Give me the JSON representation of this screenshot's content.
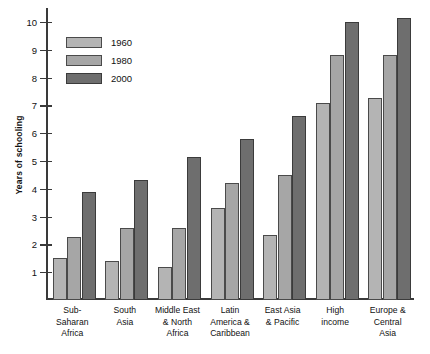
{
  "chart_data": {
    "type": "bar",
    "title": "",
    "xlabel": "",
    "ylabel": "Years of schooling",
    "ylim": [
      0,
      10.5
    ],
    "yticks": [
      1,
      2,
      3,
      4,
      5,
      6,
      7,
      8,
      9,
      10
    ],
    "ytick_labels": [
      "1",
      "2",
      "3",
      "4",
      "5",
      "6",
      "7",
      "8",
      "9",
      "10"
    ],
    "grid": false,
    "legend_position": "upper-left-inside",
    "categories": [
      "Sub-\nSaharan\nAfrica",
      "South\nAsia",
      "Middle East\n& North\nAfrica",
      "Latin\nAmerica &\nCaribbean",
      "East Asia\n& Pacific",
      "High\nincome",
      "Europe &\nCentral\nAsia"
    ],
    "category_lines": [
      [
        "Sub-",
        "Saharan",
        "Africa"
      ],
      [
        "South",
        "Asia"
      ],
      [
        "Middle East",
        "& North",
        "Africa"
      ],
      [
        "Latin",
        "America &",
        "Caribbean"
      ],
      [
        "East Asia",
        "& Pacific"
      ],
      [
        "High",
        "income"
      ],
      [
        "Europe &",
        "Central",
        "Asia"
      ]
    ],
    "series": [
      {
        "name": "1960",
        "color": "#b4b4b4",
        "values": [
          1.5,
          1.4,
          1.2,
          3.3,
          2.35,
          7.1,
          7.25
        ]
      },
      {
        "name": "1980",
        "color": "#a6a6a6",
        "values": [
          2.25,
          2.6,
          2.6,
          4.2,
          4.5,
          8.8,
          8.8
        ]
      },
      {
        "name": "2000",
        "color": "#6e6e6e",
        "values": [
          3.9,
          4.3,
          5.15,
          5.8,
          6.6,
          10.0,
          10.15
        ]
      }
    ]
  },
  "legend": {
    "items": [
      {
        "label": "1960"
      },
      {
        "label": "1980"
      },
      {
        "label": "2000"
      }
    ]
  },
  "axis": {
    "y_title": "Years of schooling"
  }
}
